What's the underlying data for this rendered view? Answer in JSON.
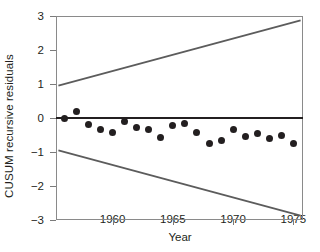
{
  "chart_data": {
    "type": "scatter",
    "title": "",
    "xlabel": "Year",
    "ylabel": "CUSUM recursive residuals",
    "xlim": [
      1955.3,
      1975.8
    ],
    "ylim": [
      -3,
      3
    ],
    "grid": false,
    "legend_position": "none",
    "xticks": [
      1960,
      1965,
      1970,
      1975
    ],
    "yticks": [
      3,
      2,
      1,
      0,
      -1,
      -2,
      -3
    ],
    "ytick_labels": [
      "3",
      "2",
      "1",
      "0",
      "−1",
      "−2",
      "−3"
    ],
    "xtick_labels": [
      "1960",
      "1965",
      "1970",
      "1975"
    ],
    "series": [
      {
        "name": "CUSUM recursive residuals",
        "marker": "filled-circle",
        "color": "#231f20",
        "x": [
          1956,
          1957,
          1958,
          1959,
          1960,
          1961,
          1962,
          1963,
          1964,
          1965,
          1966,
          1967,
          1968,
          1969,
          1970,
          1971,
          1972,
          1973,
          1974,
          1975
        ],
        "values": [
          0.0,
          0.2,
          -0.18,
          -0.33,
          -0.44,
          -0.11,
          -0.27,
          -0.34,
          -0.58,
          -0.22,
          -0.17,
          -0.42,
          -0.76,
          -0.67,
          -0.35,
          -0.54,
          -0.47,
          -0.6,
          -0.5,
          -0.76
        ]
      },
      {
        "name": "zero reference line",
        "type": "line",
        "color": "#231f20",
        "x": [
          1955.3,
          1975.8
        ],
        "values": [
          0,
          0
        ]
      },
      {
        "name": "upper critical boundary",
        "type": "line",
        "color": "#5c5c5c",
        "x": [
          1955.5,
          1975.6
        ],
        "values": [
          0.95,
          2.87
        ]
      },
      {
        "name": "lower critical boundary",
        "type": "line",
        "color": "#5c5c5c",
        "x": [
          1955.5,
          1975.6
        ],
        "values": [
          -0.95,
          -2.87
        ]
      }
    ]
  }
}
